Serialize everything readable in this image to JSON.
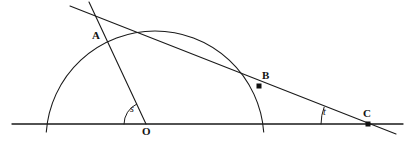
{
  "figure": {
    "background_color": "#ffffff",
    "stroke_color": "#1a1a1a",
    "label_color": "#121212",
    "width": 415,
    "height": 144
  },
  "labels": {
    "point_a": "A",
    "point_b": "B",
    "point_c": "C",
    "point_o": "O",
    "angle_s": "s",
    "angle_t": "t"
  },
  "chart_data": {
    "type": "diagram",
    "xlabel": "",
    "ylabel": "",
    "xlim": [
      0,
      415
    ],
    "ylim": [
      144,
      0
    ],
    "grid": false,
    "legend": "none",
    "geometry": {
      "baseline": {
        "name": "horizontal-diameter-line",
        "x1": 12,
        "y1": 124,
        "x2": 403,
        "y2": 124
      },
      "semicircle": {
        "name": "semicircle-arc",
        "center_x": 155,
        "center_y": 124,
        "radius": 109,
        "left_x": 46,
        "right_x": 264,
        "apex_x": 155,
        "apex_y": 15,
        "arc_overshoot": 8
      },
      "secant_line": {
        "name": "line-through-a-b-c",
        "x1": 70,
        "y1": 6,
        "x2": 396,
        "y2": 134
      },
      "radius_line": {
        "name": "line-o-to-a-extended",
        "x1": 89,
        "y1": 2,
        "x2": 146,
        "y2": 124
      },
      "points": [
        {
          "id": "A",
          "x": 96,
          "y": 24,
          "dot": false,
          "label_x": 92,
          "label_y": 30
        },
        {
          "id": "B",
          "x": 259,
          "y": 86,
          "dot": true,
          "label_x": 262,
          "label_y": 70
        },
        {
          "id": "C",
          "x": 368,
          "y": 124,
          "dot": true,
          "label_x": 363,
          "label_y": 108
        },
        {
          "id": "O",
          "x": 146,
          "y": 124,
          "dot": false,
          "label_x": 142,
          "label_y": 126
        }
      ],
      "angles": [
        {
          "id": "s",
          "vertex_x": 146,
          "vertex_y": 124,
          "radius": 22,
          "start_deg": 180,
          "end_deg": 115,
          "label_x": 130,
          "label_y": 104
        },
        {
          "id": "t",
          "vertex_x": 368,
          "vertex_y": 124,
          "radius": 47,
          "start_deg": 180,
          "end_deg": 159,
          "label_x": 323,
          "label_y": 107
        }
      ]
    }
  }
}
